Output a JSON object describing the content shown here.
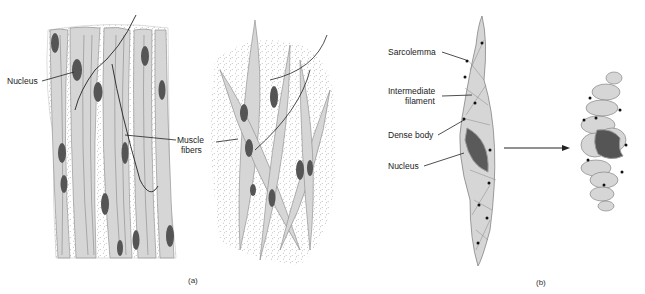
{
  "figure": {
    "panel_a": {
      "caption": "(a)",
      "labels": {
        "nucleus": "Nucleus",
        "muscle_fibers_line1": "Muscle",
        "muscle_fibers_line2": "fibers"
      }
    },
    "panel_b": {
      "caption": "(b)",
      "labels": {
        "sarcolemma": "Sarcolemma",
        "intermediate_line1": "Intermediate",
        "intermediate_line2": "filament",
        "dense_body": "Dense body",
        "nucleus": "Nucleus"
      }
    }
  },
  "colors": {
    "cell_fill": "#d6d6d6",
    "nucleus_fill": "#555555",
    "stroke": "#555555",
    "stipple": "#9a9a9a"
  }
}
